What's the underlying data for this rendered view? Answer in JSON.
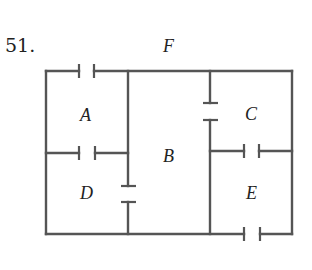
{
  "problem_number": "51.",
  "labels": {
    "F": "F",
    "A": "A",
    "B": "B",
    "C": "C",
    "D": "D",
    "E": "E"
  },
  "diagram": {
    "type": "capacitor network",
    "capacitor_count": 6,
    "regions": [
      "A",
      "B",
      "C",
      "D",
      "E",
      "F"
    ],
    "line_color": "#555555"
  }
}
